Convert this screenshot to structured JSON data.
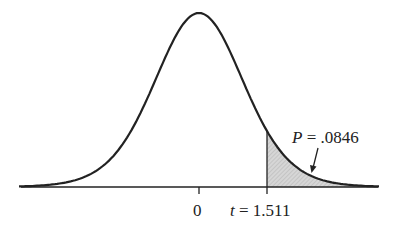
{
  "chart_data": {
    "type": "area",
    "title": "",
    "xlabel": "",
    "ylabel": "",
    "x_ticks": [
      {
        "value": 0,
        "label": "0"
      },
      {
        "value": 1.511,
        "label": "t = 1.511"
      }
    ],
    "xlim": [
      -4,
      4
    ],
    "grid": false,
    "shaded_region": {
      "from": 1.511,
      "to": 4,
      "area": 0.0846
    },
    "annotation": {
      "text": "P = .0846",
      "arrow_to": "shaded tail"
    },
    "colors": {
      "curve": "#222222",
      "shade": "#c8c8c8"
    }
  },
  "labels": {
    "zero": "0",
    "t_var": "t",
    "t_eq": " = 1.511",
    "p_var": "P",
    "p_eq": " = .0846"
  }
}
